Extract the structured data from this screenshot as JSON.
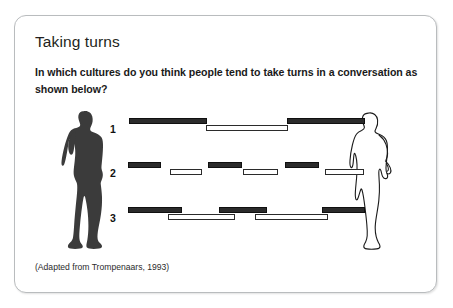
{
  "card": {
    "title": "Taking turns",
    "question": "In which cultures do you think people tend to take turns in a conversation as shown below?",
    "source": "(Adapted from Trompenaars, 1993)"
  },
  "figures": [
    {
      "name": "silhouette-man-filled",
      "style": "filled-dark-silhouette",
      "side": "left"
    },
    {
      "name": "silhouette-person-outline",
      "style": "outline-silhouette",
      "side": "right"
    }
  ],
  "diagram": {
    "rows": [
      {
        "label": "1",
        "pattern": "sequential-no-gap",
        "bars": [
          {
            "speaker": "dark",
            "x": 114,
            "width": 78,
            "lane": 0
          },
          {
            "speaker": "light",
            "x": 191,
            "width": 82,
            "lane": 1
          },
          {
            "speaker": "dark",
            "x": 272,
            "width": 78,
            "lane": 0
          }
        ]
      },
      {
        "label": "2",
        "pattern": "sequential-with-pauses",
        "bars": [
          {
            "speaker": "dark",
            "x": 113,
            "width": 33,
            "lane": 0
          },
          {
            "speaker": "light",
            "x": 155,
            "width": 32,
            "lane": 1
          },
          {
            "speaker": "dark",
            "x": 193,
            "width": 34,
            "lane": 0
          },
          {
            "speaker": "light",
            "x": 228,
            "width": 35,
            "lane": 1
          },
          {
            "speaker": "dark",
            "x": 270,
            "width": 34,
            "lane": 0
          },
          {
            "speaker": "light",
            "x": 310,
            "width": 39,
            "lane": 1
          }
        ]
      },
      {
        "label": "3",
        "pattern": "overlapping",
        "bars": [
          {
            "speaker": "dark",
            "x": 113,
            "width": 54,
            "lane": 0
          },
          {
            "speaker": "light",
            "x": 153,
            "width": 67,
            "lane": 1
          },
          {
            "speaker": "dark",
            "x": 204,
            "width": 48,
            "lane": 0
          },
          {
            "speaker": "light",
            "x": 240,
            "width": 73,
            "lane": 1
          },
          {
            "speaker": "dark",
            "x": 307,
            "width": 43,
            "lane": 0
          }
        ]
      }
    ]
  },
  "colors": {
    "dark_bar": "#2b2b2b",
    "light_bar": "#ffffff",
    "bar_outline": "#101010",
    "card_border": "#b9bcbe",
    "text": "#231f20",
    "silhouette": "#3a3a3a"
  }
}
